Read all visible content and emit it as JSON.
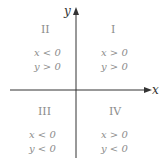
{
  "axes": {
    "x_label": "x",
    "y_label": "y"
  },
  "quadrants": [
    {
      "id": "II",
      "numeral": "II",
      "cond_x": "x < 0",
      "cond_y": "y > 0"
    },
    {
      "id": "I",
      "numeral": "I",
      "cond_x": "x > 0",
      "cond_y": "y > 0"
    },
    {
      "id": "III",
      "numeral": "III",
      "cond_x": "x < 0",
      "cond_y": "y < 0"
    },
    {
      "id": "IV",
      "numeral": "IV",
      "cond_x": "x > 0",
      "cond_y": "y < 0"
    }
  ],
  "colors": {
    "axis": "#333333",
    "text": "#8c8c8c"
  }
}
